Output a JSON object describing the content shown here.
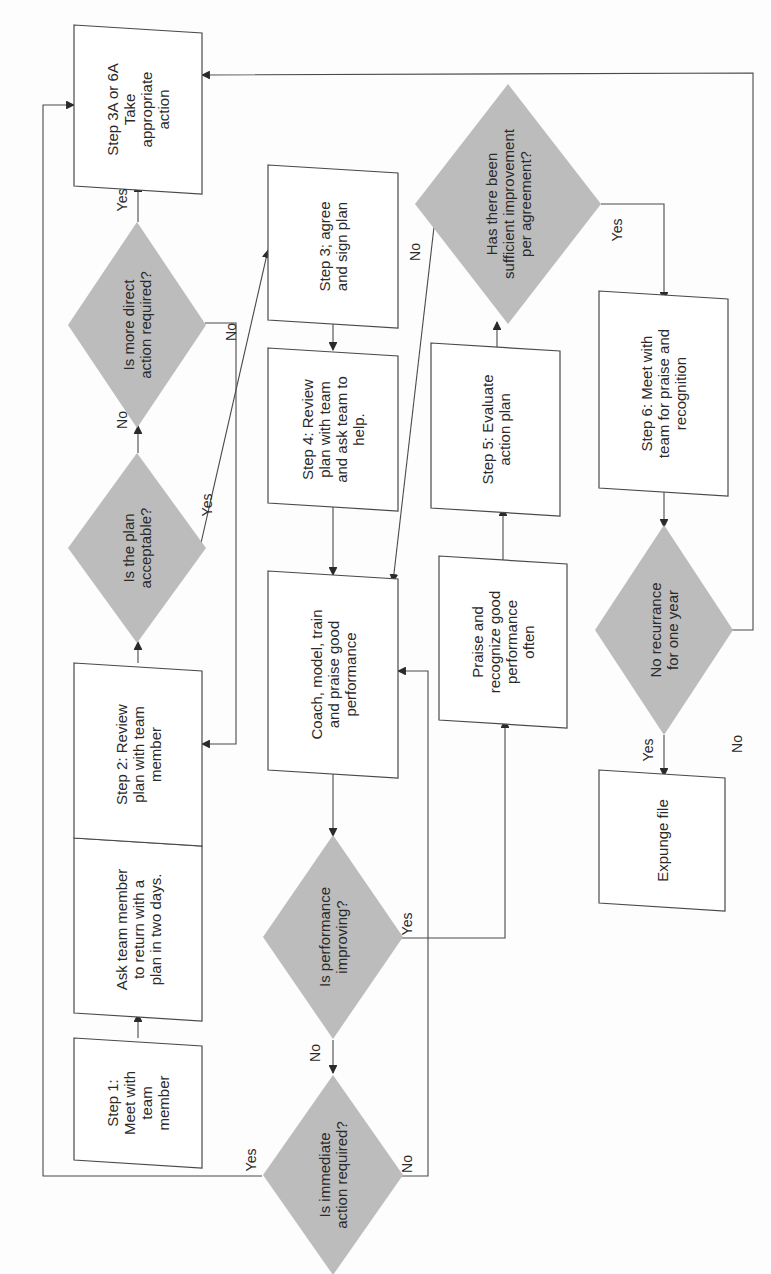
{
  "diagram": {
    "title": "",
    "orientation": "rotated-90-ccw",
    "colors": {
      "decision_fill": "#bcbcbc",
      "process_fill": "#ffffff",
      "stroke": "#4a4a4a",
      "text": "#2a2a2a"
    },
    "nodes": [
      {
        "id": "step1",
        "type": "process",
        "lines": [
          "Step 1:",
          "Meet with",
          "team",
          "member"
        ],
        "x": 74,
        "y": 1038,
        "w": 128,
        "h": 122
      },
      {
        "id": "ask",
        "type": "process",
        "lines": [
          "Ask team member",
          "to return with a",
          "plan in two days."
        ],
        "x": 74,
        "y": 838,
        "w": 128,
        "h": 175
      },
      {
        "id": "step2",
        "type": "process",
        "lines": [
          "Step 2: Review",
          "plan with team",
          "member"
        ],
        "x": 74,
        "y": 663,
        "w": 128,
        "h": 175
      },
      {
        "id": "plan_ok",
        "type": "decision",
        "lines": [
          "Is the plan",
          "acceptable?"
        ],
        "cx": 137,
        "cy": 548,
        "rw": 69,
        "rh": 95
      },
      {
        "id": "more_direct",
        "type": "decision",
        "lines": [
          "Is more direct",
          "action required?"
        ],
        "cx": 137,
        "cy": 325,
        "rw": 69,
        "rh": 103
      },
      {
        "id": "step3a",
        "type": "process",
        "lines": [
          "Step  3A  or  6A",
          "Take",
          "appropriate",
          "action"
        ],
        "x": 74,
        "y": 25,
        "w": 128,
        "h": 161
      },
      {
        "id": "step3",
        "type": "process",
        "lines": [
          "Step  3;  agree",
          "and sign plan"
        ],
        "x": 268,
        "y": 165,
        "w": 130,
        "h": 155
      },
      {
        "id": "step4",
        "type": "process",
        "lines": [
          "Step  4:  Review",
          "plan with team",
          "and ask team to",
          "help."
        ],
        "x": 268,
        "y": 348,
        "w": 130,
        "h": 155
      },
      {
        "id": "coach",
        "type": "process",
        "lines": [
          "Coach,  model,  train",
          "and praise good",
          "performance"
        ],
        "x": 268,
        "y": 571,
        "w": 130,
        "h": 199
      },
      {
        "id": "perf_improving",
        "type": "decision",
        "lines": [
          "Is performance",
          "improving?"
        ],
        "cx": 333,
        "cy": 937,
        "rw": 70,
        "rh": 102
      },
      {
        "id": "immediate",
        "type": "decision",
        "lines": [
          "Is immediate",
          "action required?"
        ],
        "cx": 333,
        "cy": 1175,
        "rw": 70,
        "rh": 100
      },
      {
        "id": "praise",
        "type": "process",
        "lines": [
          "Praise and",
          "recognize good",
          "performance",
          "often"
        ],
        "x": 439,
        "y": 556,
        "w": 128,
        "h": 164
      },
      {
        "id": "step5",
        "type": "process",
        "lines": [
          "Step  5:  Evaluate",
          "action plan"
        ],
        "x": 431,
        "y": 343,
        "w": 129,
        "h": 165
      },
      {
        "id": "sufficient",
        "type": "decision",
        "lines": [
          "Has there been",
          "sufficient improvement",
          "per agreement?"
        ],
        "cx": 508,
        "cy": 204,
        "rw": 93,
        "rh": 120
      },
      {
        "id": "step6",
        "type": "process",
        "lines": [
          "Step  6:  Meet with",
          "team  for  praise  and",
          "recognition"
        ],
        "x": 599,
        "y": 291,
        "w": 129,
        "h": 197
      },
      {
        "id": "no_recur",
        "type": "decision",
        "lines": [
          "No recurrance",
          "for one year"
        ],
        "cx": 664,
        "cy": 630,
        "rw": 69,
        "rh": 105
      },
      {
        "id": "expunge",
        "type": "process",
        "lines": [
          "Expunge  file"
        ],
        "x": 599,
        "y": 770,
        "w": 126,
        "h": 133
      }
    ],
    "edges": [
      {
        "from": "step1",
        "to": "ask",
        "label": ""
      },
      {
        "from": "step2",
        "to": "ask",
        "label": ""
      },
      {
        "from": "step2",
        "to": "plan_ok",
        "label": ""
      },
      {
        "from": "plan_ok",
        "to": "more_direct",
        "label": "No"
      },
      {
        "from": "plan_ok",
        "to": "step3",
        "label": "Yes"
      },
      {
        "from": "more_direct",
        "to": "step3a",
        "label": "Yes"
      },
      {
        "from": "more_direct",
        "to": "step2",
        "label": "No"
      },
      {
        "from": "step3",
        "to": "step4",
        "label": ""
      },
      {
        "from": "step4",
        "to": "coach",
        "label": ""
      },
      {
        "from": "coach",
        "to": "perf_improving",
        "label": ""
      },
      {
        "from": "perf_improving",
        "to": "immediate",
        "label": "No"
      },
      {
        "from": "perf_improving",
        "to": "praise",
        "label": "Yes"
      },
      {
        "from": "immediate",
        "to": "step3a",
        "label": "Yes"
      },
      {
        "from": "immediate",
        "to": "coach",
        "label": "No"
      },
      {
        "from": "praise",
        "to": "step5",
        "label": ""
      },
      {
        "from": "step5",
        "to": "sufficient",
        "label": ""
      },
      {
        "from": "sufficient",
        "to": "coach",
        "label": "No"
      },
      {
        "from": "sufficient",
        "to": "step6",
        "label": "Yes"
      },
      {
        "from": "step6",
        "to": "no_recur",
        "label": ""
      },
      {
        "from": "no_recur",
        "to": "expunge",
        "label": "Yes"
      },
      {
        "from": "no_recur",
        "to": "step3a",
        "label": "No"
      }
    ],
    "edge_labels": [
      {
        "text": "No",
        "x": 127,
        "y": 420
      },
      {
        "text": "Yes",
        "x": 127,
        "y": 200
      },
      {
        "text": "No",
        "x": 236,
        "y": 332
      },
      {
        "text": "Yes",
        "x": 212,
        "y": 505
      },
      {
        "text": "No",
        "x": 320,
        "y": 1053
      },
      {
        "text": "Yes",
        "x": 256,
        "y": 1160
      },
      {
        "text": "No",
        "x": 412,
        "y": 1164
      },
      {
        "text": "Yes",
        "x": 412,
        "y": 924
      },
      {
        "text": "No",
        "x": 420,
        "y": 252
      },
      {
        "text": "Yes",
        "x": 622,
        "y": 230
      },
      {
        "text": "No",
        "x": 742,
        "y": 744
      },
      {
        "text": "Yes",
        "x": 653,
        "y": 750
      }
    ]
  }
}
